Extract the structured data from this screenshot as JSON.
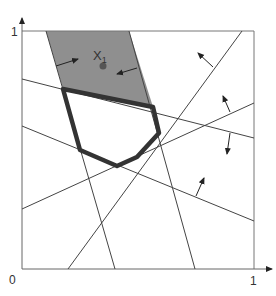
{
  "diagram": {
    "title": "",
    "axis_labels": {
      "y_top": "1",
      "origin": "0",
      "x_right": "1"
    },
    "point_label": "X",
    "point_subscript": "1",
    "colors": {
      "shaded_region": "#8f8f8f",
      "polygon_stroke": "#333333",
      "lines": "#444444",
      "point": "#555555",
      "background": "#ffffff"
    },
    "elements": [
      "unit square frame",
      "six constraint lines with normal arrows",
      "shaded feasible band containing point X1",
      "thick-outlined polygon (feasible region)"
    ]
  }
}
